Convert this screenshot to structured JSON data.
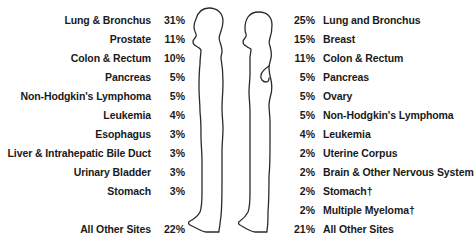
{
  "chart_data": {
    "type": "table",
    "title": "",
    "panels": [
      {
        "name": "male",
        "figure_icon": "male-silhouette-icon",
        "alignment": "right",
        "categories": [
          "Lung & Bronchus",
          "Prostate",
          "Colon & Rectum",
          "Pancreas",
          "Non-Hodgkin's Lymphoma",
          "Leukemia",
          "Esophagus",
          "Liver & Intrahepatic Bile Duct",
          "Urinary Bladder",
          "Stomach",
          "All Other Sites"
        ],
        "values": [
          31,
          11,
          10,
          5,
          5,
          4,
          3,
          3,
          3,
          3,
          22
        ],
        "value_labels": [
          "31%",
          "11%",
          "10%",
          "5%",
          "5%",
          "4%",
          "3%",
          "3%",
          "3%",
          "3%",
          "22%"
        ]
      },
      {
        "name": "female",
        "figure_icon": "female-silhouette-icon",
        "alignment": "left",
        "categories": [
          "Lung and Bronchus",
          "Breast",
          "Colon & Rectum",
          "Pancreas",
          "Ovary",
          "Non-Hodgkin's Lymphoma",
          "Leukemia",
          "Uterine Corpus",
          "Brain & Other Nervous System",
          "Stomach†",
          "Multiple Myeloma†",
          "All Other Sites"
        ],
        "values": [
          25,
          15,
          11,
          5,
          5,
          5,
          4,
          2,
          2,
          2,
          2,
          21
        ],
        "value_labels": [
          "25%",
          "15%",
          "11%",
          "5%",
          "5%",
          "5%",
          "4%",
          "2%",
          "2%",
          "2%",
          "2%",
          "21%"
        ]
      }
    ]
  },
  "male": {
    "rows": [
      {
        "label": "Lung & Bronchus",
        "pct": "31%",
        "y": 12
      },
      {
        "label": "Prostate",
        "pct": "11%",
        "y": 31
      },
      {
        "label": "Colon & Rectum",
        "pct": "10%",
        "y": 50
      },
      {
        "label": "Pancreas",
        "pct": "5%",
        "y": 69
      },
      {
        "label": "Non-Hodgkin's Lymphoma",
        "pct": "5%",
        "y": 88
      },
      {
        "label": "Leukemia",
        "pct": "4%",
        "y": 107
      },
      {
        "label": "Esophagus",
        "pct": "3%",
        "y": 126
      },
      {
        "label": "Liver & Intrahepatic Bile Duct",
        "pct": "3%",
        "y": 145
      },
      {
        "label": "Urinary Bladder",
        "pct": "3%",
        "y": 164
      },
      {
        "label": "Stomach",
        "pct": "3%",
        "y": 183
      },
      {
        "label": "All Other Sites",
        "pct": "22%",
        "y": 221
      }
    ]
  },
  "female": {
    "rows": [
      {
        "label": "Lung and Bronchus",
        "pct": "25%",
        "y": 12
      },
      {
        "label": "Breast",
        "pct": "15%",
        "y": 31
      },
      {
        "label": "Colon & Rectum",
        "pct": "11%",
        "y": 50
      },
      {
        "label": "Pancreas",
        "pct": "5%",
        "y": 69
      },
      {
        "label": "Ovary",
        "pct": "5%",
        "y": 88
      },
      {
        "label": "Non-Hodgkin's Lymphoma",
        "pct": "5%",
        "y": 107
      },
      {
        "label": "Leukemia",
        "pct": "4%",
        "y": 126
      },
      {
        "label": "Uterine Corpus",
        "pct": "2%",
        "y": 145
      },
      {
        "label": "Brain & Other Nervous System",
        "pct": "2%",
        "y": 164
      },
      {
        "label": "Stomach†",
        "pct": "2%",
        "y": 183
      },
      {
        "label": "Multiple Myeloma†",
        "pct": "2%",
        "y": 202
      },
      {
        "label": "All Other Sites",
        "pct": "21%",
        "y": 221
      }
    ]
  },
  "figures": {
    "male_icon": "male-silhouette-icon",
    "female_icon": "female-silhouette-icon"
  },
  "colors": {
    "background": "#ffffff",
    "text": "#1a1a1a",
    "outline": "#2b2b2b"
  }
}
